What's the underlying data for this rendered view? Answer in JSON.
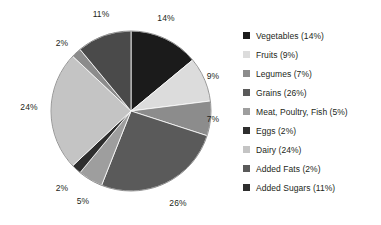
{
  "chart_data": {
    "type": "pie",
    "title": "",
    "legend_position": "right",
    "start_angle_deg": 0,
    "direction": "clockwise",
    "categories": [
      "Vegetables",
      "Fruits",
      "Legumes",
      "Grains",
      "Meat, Poultry, Fish",
      "Added Fats",
      "Dairy",
      "Eggs",
      "Added Sugars"
    ],
    "values": [
      14,
      9,
      7,
      26,
      5,
      2,
      24,
      2,
      11
    ],
    "value_unit": "%",
    "colors": [
      "#1b1b1b",
      "#dcdcdc",
      "#8c8c8c",
      "#5a5a5a",
      "#9e9e9e",
      "#2e2e2e",
      "#c4c4c4",
      "#8c8c8c",
      "#4a4a4a"
    ],
    "slices": [
      {
        "label": "Vegetables",
        "value": 14,
        "display": "14%",
        "color": "#1b1b1b"
      },
      {
        "label": "Fruits",
        "value": 9,
        "display": "9%",
        "color": "#dcdcdc"
      },
      {
        "label": "Legumes",
        "value": 7,
        "display": "7%",
        "color": "#8c8c8c"
      },
      {
        "label": "Grains",
        "value": 26,
        "display": "26%",
        "color": "#5a5a5a"
      },
      {
        "label": "Meat, Poultry, Fish",
        "value": 5,
        "display": "5%",
        "color": "#9e9e9e"
      },
      {
        "label": "Added Fats",
        "value": 2,
        "display": "2%",
        "color": "#2e2e2e"
      },
      {
        "label": "Dairy",
        "value": 24,
        "display": "24%",
        "color": "#c4c4c4"
      },
      {
        "label": "Eggs",
        "value": 2,
        "display": "2%",
        "color": "#8c8c8c"
      },
      {
        "label": "Added Sugars",
        "value": 11,
        "display": "11%",
        "color": "#4a4a4a"
      }
    ],
    "slice_labels": [
      {
        "text": "14%",
        "x": 166,
        "y": 18
      },
      {
        "text": "9%",
        "x": 213,
        "y": 76
      },
      {
        "text": "7%",
        "x": 213,
        "y": 119
      },
      {
        "text": "26%",
        "x": 178,
        "y": 203
      },
      {
        "text": "5%",
        "x": 83,
        "y": 201
      },
      {
        "text": "2%",
        "x": 62,
        "y": 188
      },
      {
        "text": "24%",
        "x": 29,
        "y": 107
      },
      {
        "text": "2%",
        "x": 62,
        "y": 43
      },
      {
        "text": "11%",
        "x": 101,
        "y": 14
      }
    ],
    "geometry": {
      "center_x": 131,
      "center_y": 111,
      "radius": 80
    }
  },
  "legend": {
    "items": [
      {
        "label": "Vegetables (14%)",
        "color": "#1b1b1b"
      },
      {
        "label": "Fruits (9%)",
        "color": "#dcdcdc"
      },
      {
        "label": "Legumes (7%)",
        "color": "#8c8c8c"
      },
      {
        "label": "Grains (26%)",
        "color": "#5a5a5a"
      },
      {
        "label": "Meat, Poultry, Fish (5%)",
        "color": "#9e9e9e"
      },
      {
        "label": "Eggs (2%)",
        "color": "#2e2e2e"
      },
      {
        "label": "Dairy (24%)",
        "color": "#c4c4c4"
      },
      {
        "label": "Added Fats (2%)",
        "color": "#5a5a5a"
      },
      {
        "label": "Added Sugars (11%)",
        "color": "#2e2e2e"
      }
    ]
  }
}
